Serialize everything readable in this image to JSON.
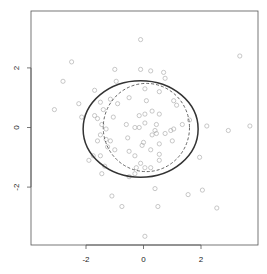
{
  "chart_data": {
    "type": "scatter",
    "title": "",
    "xlabel": "",
    "ylabel": "",
    "xlim": [
      -3.9,
      4.0
    ],
    "ylim": [
      -4.0,
      4.0
    ],
    "grid": false,
    "legend": null,
    "x_ticks": [
      -2,
      0,
      2
    ],
    "y_ticks": [
      -2,
      0,
      2
    ],
    "x_tick_labels": [
      "-2",
      "0",
      "2"
    ],
    "y_tick_labels": [
      "-2",
      "0",
      "2"
    ],
    "point_color": "#b0b0b0",
    "points": [
      [
        -0.1,
        2.95
      ],
      [
        3.35,
        2.4
      ],
      [
        -2.5,
        2.2
      ],
      [
        -1.0,
        1.95
      ],
      [
        -0.1,
        1.95
      ],
      [
        0.25,
        1.9
      ],
      [
        0.7,
        1.85
      ],
      [
        -2.8,
        1.55
      ],
      [
        -0.95,
        1.55
      ],
      [
        0.75,
        1.65
      ],
      [
        -1.7,
        1.25
      ],
      [
        0.05,
        1.3
      ],
      [
        0.55,
        1.2
      ],
      [
        -1.15,
        0.95
      ],
      [
        -0.5,
        1.0
      ],
      [
        0.1,
        0.9
      ],
      [
        1.05,
        0.9
      ],
      [
        -2.25,
        0.8
      ],
      [
        -1.5,
        0.85
      ],
      [
        -0.9,
        0.8
      ],
      [
        1.15,
        0.75
      ],
      [
        -3.1,
        0.6
      ],
      [
        -1.4,
        0.6
      ],
      [
        0.3,
        0.55
      ],
      [
        -2.15,
        0.35
      ],
      [
        -1.7,
        0.4
      ],
      [
        -1.6,
        0.3
      ],
      [
        -1.05,
        0.35
      ],
      [
        -0.15,
        0.4
      ],
      [
        0.05,
        0.45
      ],
      [
        0.55,
        0.45
      ],
      [
        1.6,
        0.25
      ],
      [
        -1.45,
        0.1
      ],
      [
        -0.6,
        0.1
      ],
      [
        0.05,
        0.15
      ],
      [
        0.45,
        0.1
      ],
      [
        1.35,
        0.1
      ],
      [
        2.2,
        0.05
      ],
      [
        3.7,
        0.05
      ],
      [
        -1.3,
        -0.05
      ],
      [
        -0.3,
        0.0
      ],
      [
        -0.15,
        0.0
      ],
      [
        0.4,
        -0.1
      ],
      [
        0.95,
        -0.1
      ],
      [
        1.05,
        -0.05
      ],
      [
        2.95,
        -0.1
      ],
      [
        -1.5,
        -0.25
      ],
      [
        0.3,
        -0.25
      ],
      [
        0.45,
        -0.2
      ],
      [
        0.75,
        -0.2
      ],
      [
        -0.55,
        -0.35
      ],
      [
        -1.6,
        -0.45
      ],
      [
        -1.3,
        -0.4
      ],
      [
        -1.15,
        -0.45
      ],
      [
        0.0,
        -0.5
      ],
      [
        0.55,
        -0.55
      ],
      [
        1.0,
        -0.45
      ],
      [
        -1.25,
        -0.65
      ],
      [
        -0.05,
        -0.6
      ],
      [
        0.25,
        -0.75
      ],
      [
        -1.0,
        -0.75
      ],
      [
        -0.5,
        -0.8
      ],
      [
        0.55,
        -0.9
      ],
      [
        -1.75,
        -0.95
      ],
      [
        -1.5,
        -0.95
      ],
      [
        -0.3,
        -0.95
      ],
      [
        1.95,
        -1.0
      ],
      [
        -1.9,
        -1.1
      ],
      [
        0.55,
        -1.1
      ],
      [
        -0.1,
        -1.2
      ],
      [
        -1.35,
        -1.3
      ],
      [
        -0.25,
        -1.35
      ],
      [
        0.05,
        -1.35
      ],
      [
        0.25,
        -1.35
      ],
      [
        -1.45,
        -1.55
      ],
      [
        -0.3,
        -1.55
      ],
      [
        -0.5,
        -1.65
      ],
      [
        0.4,
        -2.05
      ],
      [
        2.05,
        -2.1
      ],
      [
        -1.1,
        -2.3
      ],
      [
        1.55,
        -2.25
      ],
      [
        -0.75,
        -2.65
      ],
      [
        0.5,
        -2.65
      ],
      [
        2.55,
        -2.7
      ],
      [
        0.05,
        -3.65
      ]
    ],
    "overlays": [
      {
        "type": "ellipse",
        "style": "solid",
        "color": "#333333",
        "center": [
          -0.1,
          -0.05
        ],
        "rx": 2.0,
        "ry": 1.62
      },
      {
        "type": "ellipse",
        "style": "dashed",
        "color": "#555555",
        "center": [
          0.1,
          0.0
        ],
        "rx": 1.5,
        "ry": 1.48
      }
    ]
  }
}
